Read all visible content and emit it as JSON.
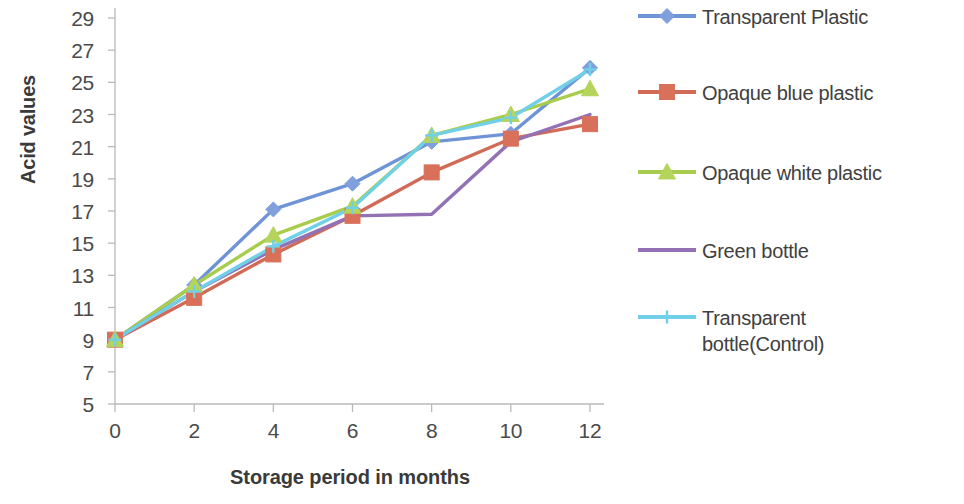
{
  "chart_data": {
    "type": "line",
    "title": "",
    "xlabel": "Storage period in months",
    "ylabel": "Acid values",
    "x": [
      0,
      2,
      4,
      6,
      8,
      10,
      12
    ],
    "xticklabels": [
      "0",
      "2",
      "4",
      "6",
      "8",
      "10",
      "12"
    ],
    "yticklabels": [
      "5",
      "7",
      "9",
      "11",
      "13",
      "15",
      "17",
      "19",
      "21",
      "23",
      "25",
      "27",
      "29"
    ],
    "yticks": [
      5,
      7,
      9,
      11,
      13,
      15,
      17,
      19,
      21,
      23,
      25,
      27,
      29
    ],
    "xlim": [
      0,
      12
    ],
    "ylim": [
      5,
      29
    ],
    "grid": false,
    "legend_position": "right",
    "series": [
      {
        "name": "Transparent Plastic",
        "color": "#6E93D6",
        "marker": "diamond",
        "marker_color": "#7FA0DC",
        "values": [
          9.0,
          12.4,
          17.1,
          18.7,
          21.3,
          21.8,
          25.9
        ]
      },
      {
        "name": "Opaque blue plastic",
        "color": "#D16A56",
        "marker": "square",
        "marker_color": "#D9705A",
        "values": [
          9.0,
          11.6,
          14.3,
          16.7,
          19.4,
          21.5,
          22.4
        ]
      },
      {
        "name": "Opaque white plastic",
        "color": "#A8CC4C",
        "marker": "triangle",
        "marker_color": "#B4D45C",
        "values": [
          9.0,
          12.4,
          15.5,
          17.3,
          21.7,
          23.0,
          24.6
        ]
      },
      {
        "name": "Green bottle",
        "color": "#9272B5",
        "marker": "none",
        "marker_color": "#9272B5",
        "values": [
          9.0,
          12.0,
          14.6,
          16.7,
          16.8,
          21.3,
          23.0
        ]
      },
      {
        "name": "Transparent bottle(Control)",
        "color": "#6FD0E8",
        "marker": "cross",
        "marker_color": "#6FD0E8",
        "values": [
          9.0,
          12.0,
          14.8,
          17.2,
          21.7,
          22.8,
          25.8
        ]
      }
    ]
  },
  "axes": {
    "y_title": "Acid values",
    "x_title": "Storage period in months"
  },
  "legend": {
    "items": [
      {
        "label": "Transparent Plastic"
      },
      {
        "label": "Opaque blue plastic"
      },
      {
        "label": "Opaque white plastic"
      },
      {
        "label": "Green bottle"
      },
      {
        "label": "Transparent \nbottle(Control)"
      }
    ]
  }
}
